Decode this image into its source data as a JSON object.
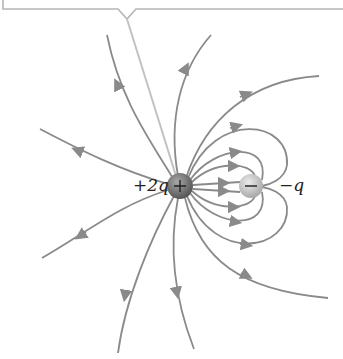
{
  "diagram": {
    "type": "electric-field-lines",
    "charges": [
      {
        "id": "positive",
        "label": "+2q",
        "sign": "+",
        "x": 180,
        "y": 186
      },
      {
        "id": "negative",
        "label": "−q",
        "sign": "−",
        "x": 251,
        "y": 186
      }
    ],
    "colors": {
      "field_line": "#8a8a8a",
      "callout_line": "#b8b8b8",
      "positive_charge": "#6e6e6e",
      "negative_charge": "#c4c4c4"
    }
  }
}
